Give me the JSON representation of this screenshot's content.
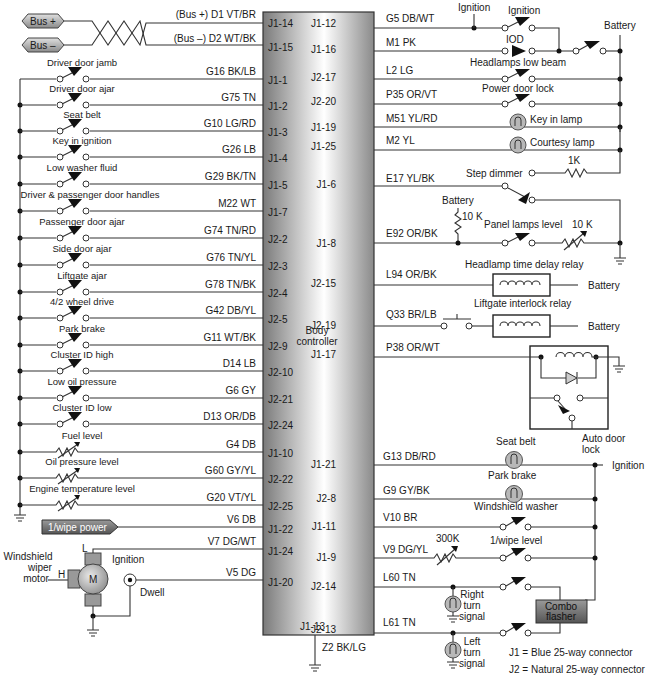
{
  "diagram": {
    "controller": {
      "label_line1": "Body",
      "label_line2": "controller",
      "gradient_dark": "#7d7d7d",
      "gradient_light": "#ffffff"
    },
    "bus": {
      "plus_label": "Bus +",
      "minus_label": "Bus –",
      "plus_wire": "(Bus +)  D1  VT/BR",
      "minus_wire": "(Bus –)  D2  WT/BK",
      "plus_pin": "J1-14",
      "minus_pin": "J1-15"
    },
    "left_switches": [
      {
        "label": "Driver door jamb",
        "wire": "G16  BK/LB",
        "pin": "J1-1"
      },
      {
        "label": "Driver door ajar",
        "wire": "G75  TN",
        "pin": "J1-2"
      },
      {
        "label": "Seat belt",
        "wire": "G10  LG/RD",
        "pin": "J1-3"
      },
      {
        "label": "Key in ignition",
        "wire": "G26  LB",
        "pin": "J1-4"
      },
      {
        "label": "Low washer fluid",
        "wire": "G29  BK/TN",
        "pin": "J1-5"
      },
      {
        "label": "Driver & passenger door handles",
        "wire": "M22  WT",
        "pin": "J1-7"
      },
      {
        "label": "Passenger door ajar",
        "wire": "G74  TN/RD",
        "pin": "J2-2"
      },
      {
        "label": "Side door ajar",
        "wire": "G76  TN/YL",
        "pin": "J2-3"
      },
      {
        "label": "Liftgate ajar",
        "wire": "G78  TN/BK",
        "pin": "J2-4"
      },
      {
        "label": "4/2 wheel drive",
        "wire": "G42  DB/YL",
        "pin": "J2-5"
      },
      {
        "label": "Park brake",
        "wire": "G11  WT/BK",
        "pin": "J2-9"
      },
      {
        "label": "Cluster ID high",
        "wire": "D14  LB",
        "pin": "J2-10"
      },
      {
        "label": "Low oil pressure",
        "wire": "G6  GY",
        "pin": "J2-21"
      },
      {
        "label": "Cluster ID low",
        "wire": "D13  OR/DB",
        "pin": "J2-24"
      }
    ],
    "left_sensors": [
      {
        "label": "Fuel level",
        "wire": "G4  DB",
        "pin": "J1-10"
      },
      {
        "label": "Oil pressure level",
        "wire": "G60  GY/YL",
        "pin": "J2-22"
      },
      {
        "label": "Engine temperature level",
        "wire": "G20  VT/YL",
        "pin": "J2-25"
      }
    ],
    "wipe_power": {
      "label": "1/wipe power",
      "wire": "V6  DB",
      "pin": "J1-22"
    },
    "wiper_motor": {
      "label_lines": [
        "Windshield",
        "wiper",
        "motor"
      ],
      "motor_symbol": "M",
      "low_label": "L",
      "high_label": "H",
      "ignition_label": "Ignition",
      "dwell_label": "Dwell",
      "low_wire": "V7  DG/WT",
      "low_pin": "J1-24",
      "dwell_wire": "V5  DG",
      "dwell_pin": "J1-20"
    },
    "ground": {
      "pin": "J1-13",
      "wire": "Z2  BK/LG"
    },
    "right_top": {
      "ignition_tap_label": "Ignition",
      "ignition_switch_label": "Ignition",
      "iod_label": "IOD",
      "battery_label": "Battery",
      "rows": [
        {
          "pin": "J1-12",
          "wire": "G5  DB/WT"
        },
        {
          "pin": "J1-16",
          "wire": "M1  PK"
        },
        {
          "pin": "J2-17",
          "wire": "L2  LG",
          "device": "Headlamps low beam"
        },
        {
          "pin": "J2-20",
          "wire": "P35  OR/VT",
          "device": "Power door lock"
        },
        {
          "pin": "J1-19",
          "wire": "M51  YL/RD",
          "device": "Key in lamp"
        },
        {
          "pin": "J1-25",
          "wire": "M2  YL",
          "device": "Courtesy lamp"
        }
      ]
    },
    "dimmer": {
      "step_label": "Step dimmer",
      "step_resistor": "1K",
      "step_pin": "J1-6",
      "step_wire": "E17  YL/BK",
      "battery_label": "Battery",
      "pullup": "10 K",
      "panel_label": "Panel lamps level",
      "panel_resistor": "10 K",
      "panel_pin": "J1-8",
      "panel_wire": "E92  OR/BK"
    },
    "relays": [
      {
        "label": "Headlamp time delay relay",
        "pin": "J2-15",
        "wire": "L94  OR/BK",
        "supply": "Battery"
      },
      {
        "label": "Liftgate interlock relay",
        "pin": "J2-19",
        "wire": "Q33  BR/LB",
        "supply": "Battery"
      }
    ],
    "auto_door_lock": {
      "pin": "J1-17",
      "wire": "P38  OR/WT",
      "label_line1": "Auto door",
      "label_line2": "lock"
    },
    "right_bottom": {
      "ignition_label": "Ignition",
      "rows": [
        {
          "pin": "J1-21",
          "wire": "G13  DB/RD",
          "device": "Seat belt"
        },
        {
          "pin": "J2-8",
          "wire": "G9  GY/BK",
          "device": "Park brake"
        },
        {
          "pin": "J1-11",
          "wire": "V10  BR",
          "device": "Windshield washer"
        },
        {
          "pin": "J1-9",
          "wire": "V9  DG/YL",
          "device": "1/wipe level",
          "resistor": "300K"
        }
      ]
    },
    "turn_signals": {
      "right": {
        "pin": "J2-14",
        "wire": "L60  TN",
        "label_lines": [
          "Right",
          "turn",
          "signal"
        ]
      },
      "left": {
        "pin": "J2-13",
        "wire": "L61  TN",
        "label_lines": [
          "Left",
          "turn",
          "signal"
        ]
      },
      "flasher_lines": [
        "Combo",
        "flasher"
      ]
    },
    "legend": [
      "J1 = Blue 25-way connector",
      "J2 = Natural  25-way connector"
    ]
  }
}
